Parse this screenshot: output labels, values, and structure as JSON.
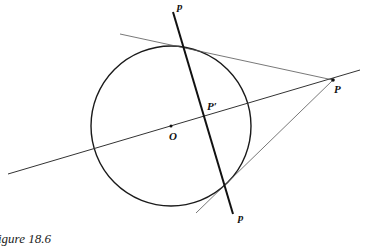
{
  "figure": {
    "caption": "igure 18.6",
    "labels": {
      "p_top": "p",
      "p_bottom": "p",
      "P": "P",
      "P_prime": "P′",
      "O": "O"
    },
    "colors": {
      "stroke": "#1a1a1a",
      "thin_stroke": "#555555",
      "background": "#ffffff"
    }
  }
}
